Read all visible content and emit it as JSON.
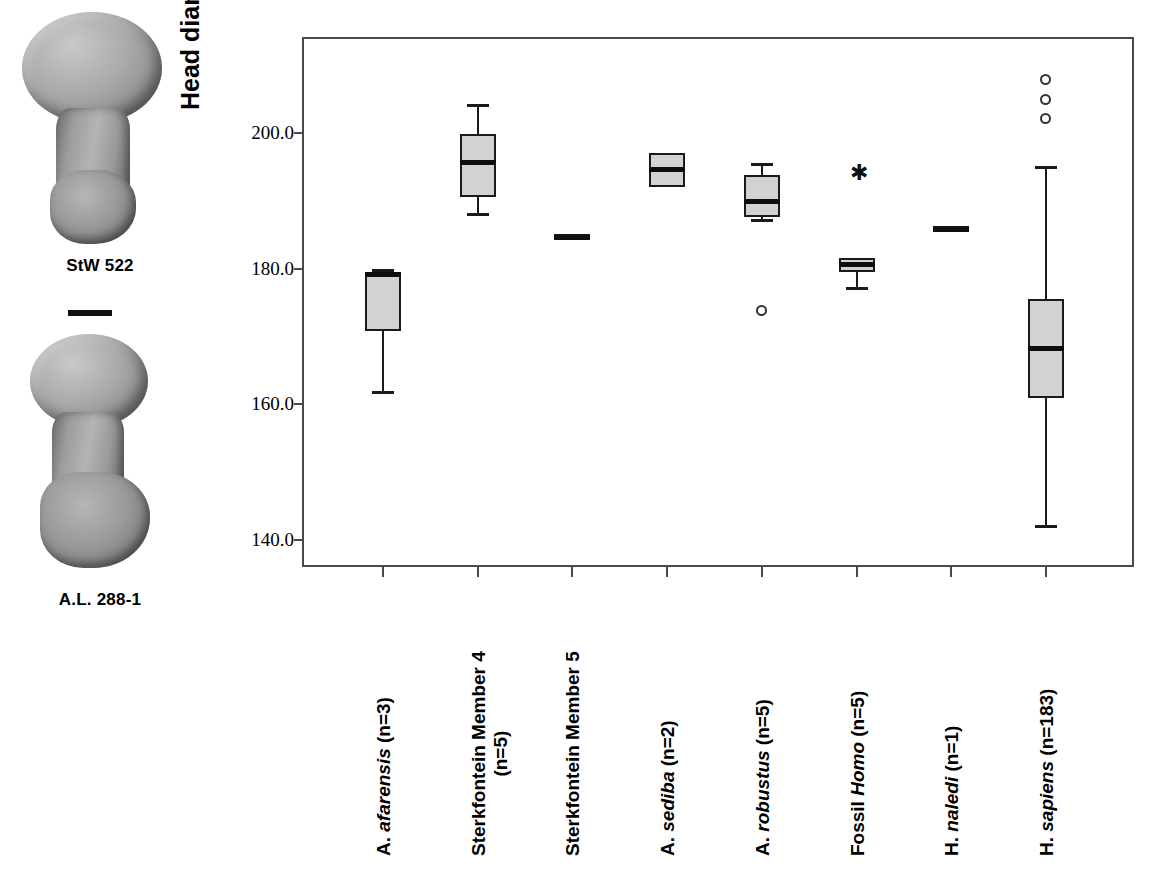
{
  "figure": {
    "specimens": [
      {
        "name": "specimen-stw-522",
        "caption": "StW 522"
      },
      {
        "name": "specimen-al-288-1",
        "caption": "A.L. 288-1"
      }
    ],
    "scale_bar": {
      "name": "scale-bar"
    }
  },
  "chart_data": {
    "type": "box",
    "title": "",
    "xlabel": "",
    "ylabel": "Head diameter/Neck breadth *100",
    "ylim": [
      133.0,
      213.5
    ],
    "yticks": [
      140.0,
      160.0,
      180.0,
      200.0
    ],
    "ytick_labels": [
      "140.0",
      "160.0",
      "180.0",
      "200.0"
    ],
    "grid": false,
    "legend": "none",
    "categories": [
      "A. afarensis (n=3)",
      "Sterkfontein Member 4 (n=5)",
      "Sterkfontein Member 5",
      "A. sediba (n=2)",
      "A. robustus (n=5)",
      "Fossil Homo (n=5)",
      "H. naledi (n=1)",
      "H. sapiens (n=183)"
    ],
    "boxes": [
      {
        "category": "A. afarensis (n=3)",
        "whisker_low": 161.5,
        "q1": 170.8,
        "median": 179.1,
        "q3": 179.4,
        "whisker_high": 179.9,
        "outliers": [],
        "extremes": [],
        "single_value": null
      },
      {
        "category": "Sterkfontein Member 4 (n=5)",
        "whisker_low": 187.7,
        "q1": 190.6,
        "median": 195.7,
        "q3": 199.8,
        "whisker_high": 204.3,
        "outliers": [],
        "extremes": [],
        "single_value": null
      },
      {
        "category": "Sterkfontein Member 5",
        "whisker_low": null,
        "q1": null,
        "median": 184.7,
        "q3": null,
        "whisker_high": null,
        "outliers": [],
        "extremes": [],
        "single_value": 184.7
      },
      {
        "category": "A. sediba (n=2)",
        "whisker_low": 192.1,
        "q1": 192.1,
        "median": 194.6,
        "q3": 197.0,
        "whisker_high": 197.0,
        "outliers": [],
        "extremes": [],
        "single_value": null
      },
      {
        "category": "A. robustus (n=5)",
        "whisker_low": 186.9,
        "q1": 187.6,
        "median": 189.9,
        "q3": 193.8,
        "whisker_high": 195.6,
        "outliers": [
          173.9
        ],
        "extremes": [],
        "single_value": null
      },
      {
        "category": "Fossil Homo (n=5)",
        "whisker_low": 176.9,
        "q1": 179.5,
        "median": 180.6,
        "q3": 181.6,
        "whisker_high": 181.6,
        "outliers": [],
        "extremes": [
          193.9
        ],
        "single_value": null
      },
      {
        "category": "H. naledi (n=1)",
        "whisker_low": null,
        "q1": null,
        "median": 185.9,
        "q3": null,
        "whisker_high": null,
        "outliers": [],
        "extremes": [],
        "single_value": 185.9
      },
      {
        "category": "H. sapiens (n=183)",
        "whisker_low": 141.8,
        "q1": 161.0,
        "median": 168.2,
        "q3": 175.6,
        "whisker_high": 195.1,
        "outliers": [
          207.9,
          204.9,
          202.2
        ],
        "extremes": [],
        "single_value": null
      }
    ]
  },
  "axis": {
    "y_title": "Head diameter/Neck breadth *100",
    "y_tick_labels": [
      "200.0",
      "180.0",
      "160.0",
      "140.0"
    ],
    "x_labels": [
      {
        "name": "x-label-a-afarensis",
        "lines": [
          {
            "text": "A. ",
            "italic": false
          },
          {
            "text": "afarensis",
            "italic": true
          },
          {
            "text": " (n=3)",
            "italic": false
          }
        ]
      },
      {
        "name": "x-label-sterkfontein-member-4",
        "lines": [
          {
            "text": "Sterkfontein Member 4",
            "italic": false
          }
        ],
        "line2": "(n=5)"
      },
      {
        "name": "x-label-sterkfontein-member-5",
        "lines": [
          {
            "text": "Sterkfontein Member 5",
            "italic": false
          }
        ]
      },
      {
        "name": "x-label-a-sediba",
        "lines": [
          {
            "text": "A. ",
            "italic": false
          },
          {
            "text": "sediba",
            "italic": true
          },
          {
            "text": " (n=2)",
            "italic": false
          }
        ]
      },
      {
        "name": "x-label-a-robustus",
        "lines": [
          {
            "text": "A. ",
            "italic": false
          },
          {
            "text": "robustus",
            "italic": true
          },
          {
            "text": " (n=5)",
            "italic": false
          }
        ]
      },
      {
        "name": "x-label-fossil-homo",
        "lines": [
          {
            "text": "Fossil ",
            "italic": false
          },
          {
            "text": "Homo",
            "italic": true
          },
          {
            "text": " (n=5)",
            "italic": false
          }
        ]
      },
      {
        "name": "x-label-h-naledi",
        "lines": [
          {
            "text": "H. ",
            "italic": false
          },
          {
            "text": "naledi",
            "italic": true
          },
          {
            "text": " (n=1)",
            "italic": false
          }
        ]
      },
      {
        "name": "x-label-h-sapiens",
        "lines": [
          {
            "text": "H. ",
            "italic": false
          },
          {
            "text": "sapiens",
            "italic": true
          },
          {
            "text": " (n=183)",
            "italic": false
          }
        ]
      }
    ]
  },
  "style": {
    "box_fill": "#d2d2d2",
    "box_stroke": "#1a1a1a",
    "frame_stroke": "#4a4a4a",
    "outlier_stroke": "#333333",
    "star_glyph": "✱"
  }
}
